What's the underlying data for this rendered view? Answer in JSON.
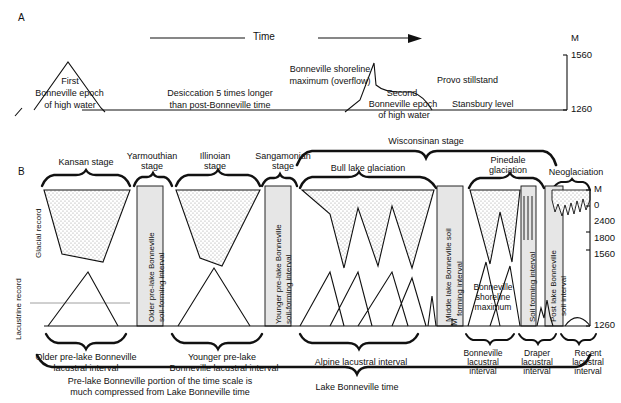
{
  "figure": {
    "panels": [
      "A",
      "B"
    ],
    "panel_a_letter": "A",
    "panel_b_letter": "B"
  },
  "panel_a": {
    "time_axis_label": "Time",
    "elevation_unit": "M",
    "elevation_top": "1560",
    "elevation_bottom": "1260",
    "labels": {
      "first_epoch_l1": "First",
      "first_epoch_l2": "Bonneville epoch",
      "first_epoch_l3": "of high water",
      "desiccation_l1": "Desiccation 5 times longer",
      "desiccation_l2": "than post-Bonneville time",
      "shoreline_l1": "Bonneville shoreline",
      "shoreline_l2": "maximum (overflow)",
      "second_epoch_l1": "Second",
      "second_epoch_l2": "Bonneville epoch",
      "second_epoch_l3": "of high water",
      "provo": "Provo stillstand",
      "stansbury": "Stansbury level"
    }
  },
  "panel_b": {
    "row_labels": {
      "glacial": "Glacial record",
      "lacustrine": "Lacustrine record"
    },
    "top_bracket": "Wisconsinan stage",
    "stage_labels": [
      {
        "name": "Kansan stage",
        "lines": [
          "Kansan stage"
        ]
      },
      {
        "name": "Yarmouthian stage",
        "lines": [
          "Yarmouthian",
          "stage"
        ]
      },
      {
        "name": "Illinoian stage",
        "lines": [
          "Illinoian",
          "stage"
        ]
      },
      {
        "name": "Sangamonian stage",
        "lines": [
          "Sangamonian",
          "stage"
        ]
      },
      {
        "name": "Bull lake glaciation",
        "lines": [
          "Bull lake glaciation"
        ]
      },
      {
        "name": "Pinedale glaciation",
        "lines": [
          "Pinedale",
          "glaciation"
        ]
      },
      {
        "name": "Neoglaciation",
        "lines": [
          "Neoglaciation"
        ]
      }
    ],
    "vertical_intervals": [
      {
        "name": "older-pre-lake-soil",
        "l1": "Older pre-lake Bonneville",
        "l2": "soil-forming interval"
      },
      {
        "name": "younger-pre-lake-soil",
        "l1": "Younger pre-lake Bonneville",
        "l2": "soil-forming interval"
      },
      {
        "name": "middle-lake-soil",
        "l1": "Middle lake Bonneville soil",
        "l2": "forming interval"
      },
      {
        "name": "soil-forming-interval",
        "l1": "Soil forming interval",
        "l2": ""
      },
      {
        "name": "post-lake-soil",
        "l1": "Post lake Bonneville",
        "l2": "soil interval"
      }
    ],
    "inline_annotations": {
      "bonneville_shoreline_l1": "Bonneville",
      "bonneville_shoreline_l2": "shoreline",
      "bonneville_shoreline_l3": "maximum"
    },
    "bottom_intervals": [
      {
        "name": "older-pre-lake-lacustral",
        "lines": [
          "Older pre-lake Bonneville",
          "lacustral interval"
        ]
      },
      {
        "name": "younger-pre-lake-lacustral",
        "lines": [
          "Younger pre-lake",
          "Bonneville lacustral interval"
        ]
      },
      {
        "name": "alpine-lacustral",
        "lines": [
          "Alpine lacustral interval"
        ]
      },
      {
        "name": "bonneville-lacustral",
        "lines": [
          "Bonneville",
          "lacustral",
          "interval"
        ]
      },
      {
        "name": "draper-lacustral",
        "lines": [
          "Draper",
          "lacustral",
          "interval"
        ]
      },
      {
        "name": "recent-lacustral",
        "lines": [
          "Recent",
          "lacustral",
          "interval"
        ]
      }
    ],
    "note": {
      "l1": "Pre-lake Bonneville portion of the time scale is",
      "l2": "much compressed from Lake Bonneville time"
    },
    "bottom_bracket": "Lake Bonneville time",
    "elevation_axis": {
      "unit": "M",
      "ticks": [
        "0",
        "2400",
        "1800",
        "1560",
        "1260"
      ]
    }
  },
  "colors": {
    "ink": "#111111",
    "stipple_fill": "#e8e8e8",
    "soil_band_fill": "#e3e3e3",
    "background": "#ffffff"
  }
}
